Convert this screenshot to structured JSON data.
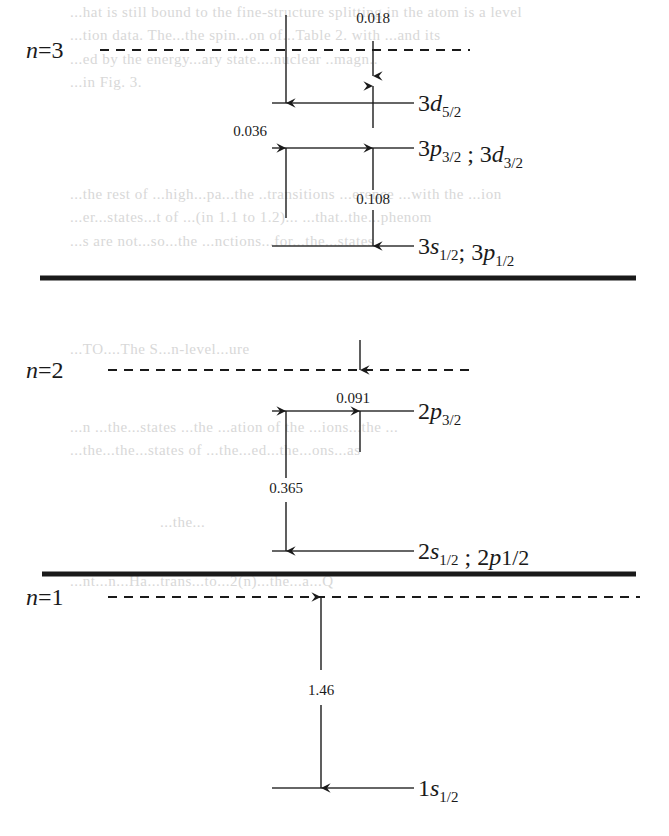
{
  "units_note": "Splittings shown in level-spacing units as printed",
  "ghost_text": [
    {
      "text": "...hat is still bound to the fine-structure splitting in the atom is a level",
      "x": 70,
      "y": 4
    },
    {
      "text": "...tion data. The...the spin...on of...Table 2. with ...and its",
      "x": 70,
      "y": 27
    },
    {
      "text": "...ed by the energy...ary state....nuclear ..magn..",
      "x": 70,
      "y": 51
    },
    {
      "text": "...in Fig. 3.",
      "x": 70,
      "y": 74
    },
    {
      "text": "...the rest of ...high...pa...the ..transitions ...erence ...with the ...ion",
      "x": 70,
      "y": 186
    },
    {
      "text": "...er...states...t of ...(in 1.1 to 1.2)... ...that..the...phenom",
      "x": 70,
      "y": 209
    },
    {
      "text": "...s are not...so...the ...nctions...for...the...states.",
      "x": 70,
      "y": 233
    },
    {
      "text": "...TO....The S...n-level...ure",
      "x": 70,
      "y": 341
    },
    {
      "text": "...n ...the...states ...the ...ation of the ...ions...the ...",
      "x": 70,
      "y": 419
    },
    {
      "text": "...the...the...states of ...the...ed...the...ons...as",
      "x": 70,
      "y": 442
    },
    {
      "text": "...the...",
      "x": 160,
      "y": 514
    },
    {
      "text": "...nt...n...Ha...trans...to...2(n)...the...a...Q",
      "x": 70,
      "y": 573
    }
  ],
  "shells": [
    {
      "id": "n3",
      "label_n": "n",
      "label_eq": "=",
      "label_num": "3",
      "y": 50,
      "x1": 100,
      "x2": 470
    },
    {
      "id": "n2",
      "label_n": "n",
      "label_eq": "=",
      "label_num": "2",
      "y": 370,
      "x1": 108,
      "x2": 470
    },
    {
      "id": "n1",
      "label_n": "n",
      "label_eq": "=",
      "label_num": "1",
      "y": 597,
      "x1": 108,
      "x2": 640
    }
  ],
  "separators": [
    {
      "y": 278,
      "x1": 40,
      "x2": 636
    },
    {
      "y": 574,
      "x1": 42,
      "x2": 636
    }
  ],
  "levels": [
    {
      "id": "3d52",
      "y": 103,
      "x1": 272,
      "x2": 414,
      "parts": [
        {
          "main": "3",
          "sym": "d",
          "sub": "5/2"
        }
      ]
    },
    {
      "id": "3p32-3d32",
      "y": 148,
      "x1": 272,
      "x2": 414,
      "parts": [
        {
          "main": "3",
          "sym": "p",
          "sub": "3/2"
        },
        {
          "sep": " ; "
        },
        {
          "main": "3",
          "sym": "d",
          "sub": "3/2"
        }
      ]
    },
    {
      "id": "3s12-3p12",
      "y": 246,
      "x1": 272,
      "x2": 414,
      "parts": [
        {
          "main": "3",
          "sym": "s",
          "sub": "1/2"
        },
        {
          "sep": "; "
        },
        {
          "main": "3",
          "sym": "p",
          "sub": "1/2"
        }
      ]
    },
    {
      "id": "2p32",
      "y": 411,
      "x1": 272,
      "x2": 414,
      "parts": [
        {
          "main": "2",
          "sym": "p",
          "sub": "3/2"
        }
      ]
    },
    {
      "id": "2s12-2p12",
      "y": 551,
      "x1": 272,
      "x2": 414,
      "parts": [
        {
          "main": "2",
          "sym": "s",
          "sub": "1/2"
        },
        {
          "sep": " ; "
        },
        {
          "main": "2",
          "sym": "p",
          "sub": "1/2",
          "upright": true
        }
      ]
    },
    {
      "id": "1s12",
      "y": 788,
      "x1": 272,
      "x2": 414,
      "parts": [
        {
          "main": "1",
          "sym": "s",
          "sub": "1/2"
        }
      ]
    }
  ],
  "splittings": [
    {
      "value": "0.018",
      "label_x": 373,
      "label_y": 18,
      "desc": "n=3 dashed to 3d5/2 (right column)"
    },
    {
      "value": "0.036",
      "label_x": 250,
      "label_y": 131,
      "desc": "n=3 dashed to 3p3/2 (left column)"
    },
    {
      "value": "0.108",
      "label_x": 373,
      "label_y": 199,
      "desc": "3p3/2 to 3s1/2"
    },
    {
      "value": "0.091",
      "label_x": 353,
      "label_y": 398,
      "desc": "n=2 dashed to 2p3/2"
    },
    {
      "value": "0.365",
      "label_x": 286,
      "label_y": 488,
      "desc": "2p3/2 to 2s1/2"
    },
    {
      "value": "1.46",
      "label_x": 321,
      "label_y": 690,
      "desc": "n=1 dashed to 1s1/2"
    }
  ],
  "arrows": [
    {
      "x": 286,
      "y1": 15,
      "y2": 103,
      "dir": "down"
    },
    {
      "x": 373,
      "y1": 41,
      "y2": 76,
      "dir": "down"
    },
    {
      "x": 373,
      "y1": 128,
      "y2": 86,
      "dir": "up"
    },
    {
      "x": 286,
      "y1": 218,
      "y2": 148,
      "dir": "up"
    },
    {
      "x": 373,
      "y1": 190,
      "y2": 148,
      "dir": "up"
    },
    {
      "x": 373,
      "y1": 210,
      "y2": 246,
      "dir": "down"
    },
    {
      "x": 360,
      "y1": 340,
      "y2": 370,
      "dir": "down"
    },
    {
      "x": 360,
      "y1": 452,
      "y2": 411,
      "dir": "up"
    },
    {
      "x": 286,
      "y1": 478,
      "y2": 411,
      "dir": "up"
    },
    {
      "x": 286,
      "y1": 502,
      "y2": 551,
      "dir": "down"
    },
    {
      "x": 321,
      "y1": 670,
      "y2": 597,
      "dir": "up"
    },
    {
      "x": 321,
      "y1": 705,
      "y2": 788,
      "dir": "down"
    }
  ],
  "colors": {
    "ink": "#1a1a1a",
    "ghost": "#d8d8d8",
    "level_line": "#333333",
    "background": "#ffffff"
  }
}
